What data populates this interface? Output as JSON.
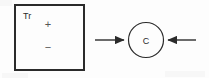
{
  "figure": {
    "kind": "schematic-diagram",
    "background_color": "#fdfdfd",
    "stroke_color": "#2b2b2b",
    "box": {
      "label": "Tr",
      "shape_name": "rectangle",
      "plus_sign": "+",
      "minus_sign": "−",
      "x": 14,
      "y": 4,
      "width": 71,
      "height": 67,
      "border_width": 2
    },
    "node": {
      "label": "C",
      "shape_name": "circle",
      "center_x": 146,
      "center_y": 40,
      "radius": 18,
      "stroke_width": 1.2
    },
    "arrows": [
      {
        "name": "left-arrow",
        "direction": "right",
        "glyph": "→",
        "x_start": 95,
        "x_end": 127,
        "y": 40
      },
      {
        "name": "right-arrow",
        "direction": "left",
        "glyph": "←",
        "x_start": 196,
        "x_end": 165,
        "y": 40
      }
    ]
  }
}
